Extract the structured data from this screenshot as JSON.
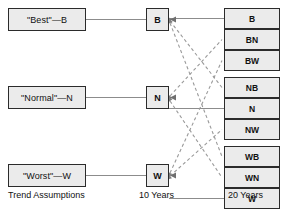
{
  "diagram": {
    "colors": {
      "box_fill": "#ebebeb",
      "box_border": "#2b2b2b",
      "solid_edge": "#8c8c8c",
      "dashed_edge": "#9a9a9a",
      "background": "#ffffff",
      "text": "#111111"
    },
    "columns": [
      {
        "id": "trend",
        "label": "Trend Assumptions",
        "label_x": 8,
        "label_y": 190
      },
      {
        "id": "ten",
        "label": "10 Years",
        "label_x": 139,
        "label_y": 190
      },
      {
        "id": "twenty",
        "label": "20 Years",
        "label_x": 228,
        "label_y": 190
      }
    ],
    "trend_nodes": [
      {
        "id": "trend-best",
        "label": "\"Best\"—B",
        "x": 8,
        "y": 8,
        "w": 78,
        "h": 23
      },
      {
        "id": "trend-normal",
        "label": "\"Normal\"—N",
        "x": 8,
        "y": 86,
        "w": 78,
        "h": 23
      },
      {
        "id": "trend-worst",
        "label": "\"Worst\"—W",
        "x": 8,
        "y": 164,
        "w": 78,
        "h": 23
      },
      {
        "id": "trend-dummy",
        "label": "",
        "x": 0,
        "y": 0,
        "w": 0,
        "h": 0
      }
    ],
    "mid_nodes": [
      {
        "id": "mid-b",
        "label": "B",
        "x": 146,
        "y": 8,
        "w": 23,
        "h": 23
      },
      {
        "id": "mid-n",
        "label": "N",
        "x": 146,
        "y": 86,
        "w": 23,
        "h": 23
      },
      {
        "id": "mid-w",
        "label": "W",
        "x": 146,
        "y": 164,
        "w": 23,
        "h": 23
      }
    ],
    "leaf_groups": [
      {
        "id": "leaf-group-b",
        "nodes": [
          {
            "id": "leaf-b",
            "label": "B",
            "x": 224,
            "y": 8,
            "w": 56,
            "h": 21
          },
          {
            "id": "leaf-bn",
            "label": "BN",
            "x": 224,
            "y": 29,
            "w": 56,
            "h": 21
          },
          {
            "id": "leaf-bw",
            "label": "BW",
            "x": 224,
            "y": 50,
            "w": 56,
            "h": 21
          }
        ]
      },
      {
        "id": "leaf-group-n",
        "nodes": [
          {
            "id": "leaf-nb",
            "label": "NB",
            "x": 224,
            "y": 77,
            "w": 56,
            "h": 21
          },
          {
            "id": "leaf-n",
            "label": "N",
            "x": 224,
            "y": 98,
            "w": 56,
            "h": 21
          },
          {
            "id": "leaf-nw",
            "label": "NW",
            "x": 224,
            "y": 119,
            "w": 56,
            "h": 21
          }
        ]
      },
      {
        "id": "leaf-group-w",
        "nodes": [
          {
            "id": "leaf-wb",
            "label": "WB",
            "x": 224,
            "y": 146,
            "w": 56,
            "h": 21
          },
          {
            "id": "leaf-wn",
            "label": "WN",
            "x": 224,
            "y": 167,
            "w": 56,
            "h": 21
          },
          {
            "id": "leaf-w",
            "label": "W",
            "x": 224,
            "y": 188,
            "w": 56,
            "h": 21
          }
        ]
      }
    ],
    "solid_edges": [
      {
        "id": "edge-trend-best-to-mid-b",
        "x1": 86,
        "y1": 19.5,
        "x2": 146,
        "y2": 19.5
      },
      {
        "id": "edge-trend-normal-to-mid-n",
        "x1": 86,
        "y1": 97.5,
        "x2": 146,
        "y2": 97.5
      },
      {
        "id": "edge-trend-worst-to-mid-w",
        "x1": 86,
        "y1": 175.5,
        "x2": 146,
        "y2": 175.5
      },
      {
        "id": "edge-mid-b-to-leaf-b",
        "x1": 169,
        "y1": 18.5,
        "x2": 224,
        "y2": 18.5
      },
      {
        "id": "edge-mid-n-to-leaf-n",
        "x1": 169,
        "y1": 108.5,
        "x2": 224,
        "y2": 108.5
      },
      {
        "id": "edge-mid-w-to-leaf-w",
        "x1": 169,
        "y1": 198.5,
        "x2": 224,
        "y2": 198.5
      }
    ],
    "dashed_edges": [
      {
        "id": "edge-mid-b-to-leaf-nb",
        "x1": 170,
        "y1": 21,
        "x2": 222,
        "y2": 87.5
      },
      {
        "id": "edge-mid-b-to-leaf-wb",
        "x1": 170,
        "y1": 23,
        "x2": 222,
        "y2": 156.5
      },
      {
        "id": "edge-mid-n-to-leaf-bn",
        "x1": 170,
        "y1": 96,
        "x2": 222,
        "y2": 39.5
      },
      {
        "id": "edge-mid-n-to-leaf-wn",
        "x1": 170,
        "y1": 101,
        "x2": 222,
        "y2": 177.5
      },
      {
        "id": "edge-mid-w-to-leaf-bw",
        "x1": 170,
        "y1": 173,
        "x2": 222,
        "y2": 60.5
      },
      {
        "id": "edge-mid-w-to-leaf-nw",
        "x1": 170,
        "y1": 176,
        "x2": 222,
        "y2": 129.5
      }
    ],
    "arrow_targets": [
      {
        "id": "arrow-into-mid-b",
        "x": 170,
        "y": 19.5,
        "dir": "left"
      },
      {
        "id": "arrow-into-mid-n",
        "x": 170,
        "y": 97.5,
        "dir": "left"
      },
      {
        "id": "arrow-into-mid-w",
        "x": 170,
        "y": 175.5,
        "dir": "left"
      }
    ]
  }
}
